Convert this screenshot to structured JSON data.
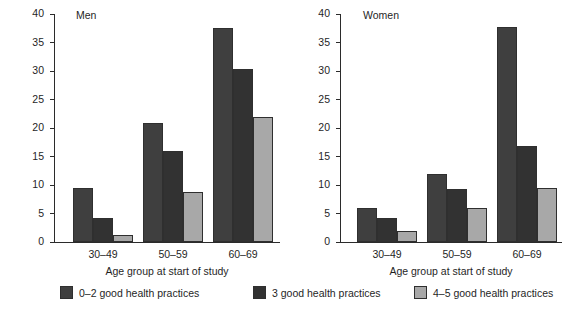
{
  "chart_data": {
    "type": "bar",
    "title": "",
    "xlabel": "Age group at start of study",
    "ylabel": "Percentage who died from all causes",
    "ylim": [
      0,
      40
    ],
    "yticks": [
      0,
      5,
      10,
      15,
      20,
      25,
      30,
      35,
      40
    ],
    "categories": [
      "30–49",
      "50–59",
      "60–69"
    ],
    "grid": false,
    "legend_position": "bottom",
    "legend": [
      "0–2 good health practices",
      "3 good health practices",
      "4–5 good health practices"
    ],
    "colors": [
      "#3f3f3f",
      "#323232",
      "#a8a8a8"
    ],
    "panels": [
      {
        "title": "Men",
        "series": [
          {
            "name": "0–2 good health practices",
            "color": "#3f3f3f",
            "values": [
              9.5,
              20.8,
              37.5
            ]
          },
          {
            "name": "3 good health practices",
            "color": "#323232",
            "values": [
              4.3,
              15.9,
              30.4
            ]
          },
          {
            "name": "4–5 good health practices",
            "color": "#a8a8a8",
            "values": [
              1.2,
              8.7,
              21.9
            ]
          }
        ]
      },
      {
        "title": "Women",
        "series": [
          {
            "name": "0–2 good health practices",
            "color": "#3f3f3f",
            "values": [
              5.9,
              12.0,
              37.7
            ]
          },
          {
            "name": "3 good health practices",
            "color": "#323232",
            "values": [
              4.2,
              9.3,
              16.8
            ]
          },
          {
            "name": "4–5 good health practices",
            "color": "#a8a8a8",
            "values": [
              2.0,
              5.9,
              9.5
            ]
          }
        ]
      }
    ]
  }
}
